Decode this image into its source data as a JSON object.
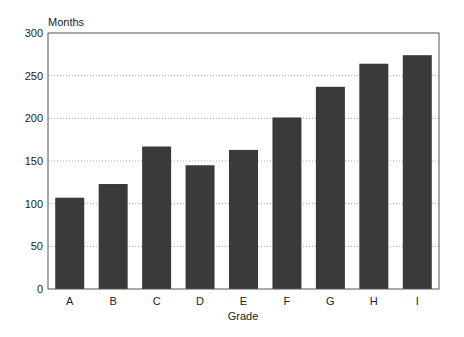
{
  "chart_data": {
    "type": "bar",
    "title": "",
    "xlabel": "Grade",
    "ylabel": "Months",
    "categories": [
      "A",
      "B",
      "C",
      "D",
      "E",
      "F",
      "G",
      "H",
      "I"
    ],
    "values": [
      107,
      123,
      167,
      145,
      163,
      201,
      237,
      264,
      274
    ],
    "ylim": [
      0,
      300
    ],
    "yticks": [
      0,
      50,
      100,
      150,
      200,
      250,
      300
    ],
    "grid": "horizontal dotted",
    "legend": "none",
    "bar_color": "#3a3a3a"
  }
}
